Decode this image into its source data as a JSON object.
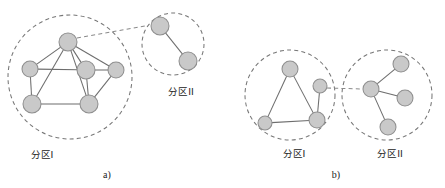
{
  "figure": {
    "type": "diagram",
    "background_color": "#ffffff",
    "node_fill_color": "#c9c9c9",
    "node_stroke_color": "#8f8f8f",
    "edge_color": "#6d6d6d",
    "ring_color": "#777777",
    "text_color": "#222222",
    "width": 445,
    "height": 188
  },
  "panels": [
    {
      "id": "panel-a",
      "label": "a)",
      "label_pos": {
        "x": 107,
        "y": 178
      },
      "clusters": [
        {
          "id": "a-partition-1",
          "label": "分区I",
          "label_pos": {
            "x": 42,
            "y": 158
          },
          "ring": {
            "cx": 70,
            "cy": 77,
            "r": 62
          },
          "nodes": [
            {
              "id": "a1-n1",
              "cx": 68,
              "cy": 42,
              "r": 9
            },
            {
              "id": "a1-n2",
              "cx": 30,
              "cy": 69,
              "r": 8
            },
            {
              "id": "a1-n3",
              "cx": 86,
              "cy": 70,
              "r": 9
            },
            {
              "id": "a1-n4",
              "cx": 116,
              "cy": 70,
              "r": 8
            },
            {
              "id": "a1-n5",
              "cx": 32,
              "cy": 104,
              "r": 9
            },
            {
              "id": "a1-n6",
              "cx": 89,
              "cy": 104,
              "r": 9
            }
          ],
          "edges": [
            [
              "a1-n1",
              "a1-n2"
            ],
            [
              "a1-n1",
              "a1-n3"
            ],
            [
              "a1-n1",
              "a1-n4"
            ],
            [
              "a1-n1",
              "a1-n5"
            ],
            [
              "a1-n1",
              "a1-n6"
            ],
            [
              "a1-n2",
              "a1-n3"
            ],
            [
              "a1-n2",
              "a1-n5"
            ],
            [
              "a1-n3",
              "a1-n4"
            ],
            [
              "a1-n3",
              "a1-n6"
            ],
            [
              "a1-n4",
              "a1-n6"
            ],
            [
              "a1-n5",
              "a1-n6"
            ]
          ]
        },
        {
          "id": "a-partition-2",
          "label": "分区II",
          "label_pos": {
            "x": 181,
            "y": 95
          },
          "ring": {
            "cx": 173,
            "cy": 44,
            "r": 31
          },
          "nodes": [
            {
              "id": "a2-n1",
              "cx": 160,
              "cy": 26,
              "r": 9
            },
            {
              "id": "a2-n2",
              "cx": 188,
              "cy": 61,
              "r": 9
            }
          ],
          "edges": [
            [
              "a2-n1",
              "a2-n2"
            ]
          ]
        }
      ],
      "bridges": [
        {
          "from": {
            "x": 77,
            "y": 38
          },
          "to": {
            "x": 145,
            "y": 26
          }
        }
      ]
    },
    {
      "id": "panel-b",
      "label": "b)",
      "label_pos": {
        "x": 336,
        "y": 178
      },
      "clusters": [
        {
          "id": "b-partition-1",
          "label": "分区I",
          "label_pos": {
            "x": 294,
            "y": 157
          },
          "ring": {
            "cx": 290,
            "cy": 95,
            "r": 45
          },
          "nodes": [
            {
              "id": "b1-n1",
              "cx": 290,
              "cy": 69,
              "r": 8
            },
            {
              "id": "b1-n2",
              "cx": 320,
              "cy": 86,
              "r": 7
            },
            {
              "id": "b1-n3",
              "cx": 265,
              "cy": 123,
              "r": 7
            },
            {
              "id": "b1-n4",
              "cx": 317,
              "cy": 120,
              "r": 8
            }
          ],
          "edges": [
            [
              "b1-n1",
              "b1-n3"
            ],
            [
              "b1-n1",
              "b1-n4"
            ],
            [
              "b1-n3",
              "b1-n4"
            ],
            [
              "b1-n2",
              "b1-n4"
            ]
          ]
        },
        {
          "id": "b-partition-2",
          "label": "分区II",
          "label_pos": {
            "x": 390,
            "y": 157
          },
          "ring": {
            "cx": 387,
            "cy": 95,
            "r": 45
          },
          "nodes": [
            {
              "id": "b2-n1",
              "cx": 371,
              "cy": 89,
              "r": 8
            },
            {
              "id": "b2-n2",
              "cx": 401,
              "cy": 64,
              "r": 8
            },
            {
              "id": "b2-n3",
              "cx": 405,
              "cy": 98,
              "r": 8
            },
            {
              "id": "b2-n4",
              "cx": 388,
              "cy": 127,
              "r": 8
            }
          ],
          "edges": [
            [
              "b2-n1",
              "b2-n2"
            ],
            [
              "b2-n1",
              "b2-n3"
            ],
            [
              "b2-n1",
              "b2-n4"
            ]
          ]
        }
      ],
      "bridges": [
        {
          "from": {
            "x": 327,
            "y": 88
          },
          "to": {
            "x": 363,
            "y": 89
          }
        }
      ]
    }
  ]
}
